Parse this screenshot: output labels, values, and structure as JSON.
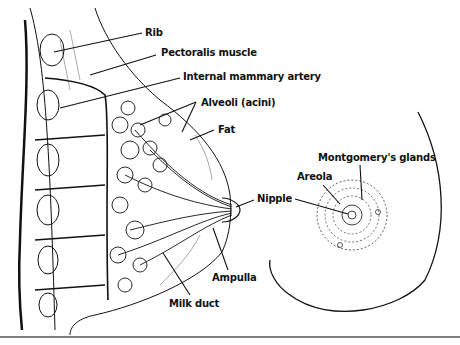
{
  "diagram": {
    "left_view": "Sagittal section of breast",
    "right_view": "Anterior view of breast",
    "labels": {
      "rib": "Rib",
      "pectoralis": "Pectoralis muscle",
      "artery": "Internal mammary artery",
      "alveoli": "Alveoli (acini)",
      "fat": "Fat",
      "montgomery": "Montgomery's glands",
      "areola": "Areola",
      "nipple": "Nipple",
      "ampulla": "Ampulla",
      "milk_duct": "Milk duct"
    },
    "colors": {
      "ink": "#111111",
      "paper": "#ffffff",
      "rule": "#555555"
    }
  }
}
